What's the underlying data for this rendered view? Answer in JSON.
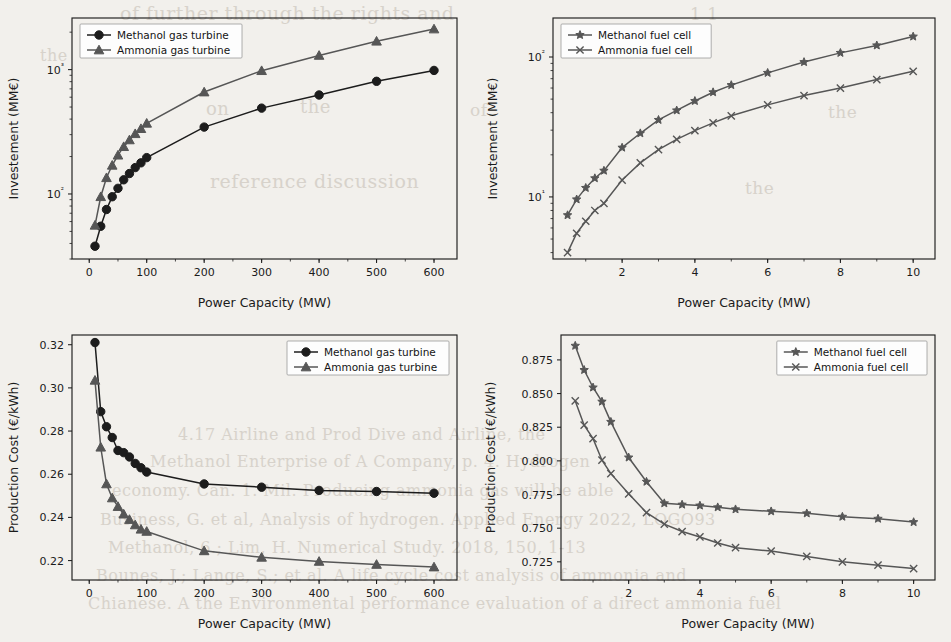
{
  "page": {
    "background_color": "#f2f0ec",
    "ghost_text_color": "#cfc9c0",
    "ghost_lines": [
      {
        "text": "of further through the rights and",
        "x": 120,
        "y": 2,
        "size": 19
      },
      {
        "text": "1 1",
        "x": 690,
        "y": 4,
        "size": 17
      },
      {
        "text": "the",
        "x": 40,
        "y": 46,
        "size": 16
      },
      {
        "text": "on",
        "x": 206,
        "y": 98,
        "size": 18
      },
      {
        "text": "the",
        "x": 300,
        "y": 96,
        "size": 18
      },
      {
        "text": "of",
        "x": 470,
        "y": 100,
        "size": 17
      },
      {
        "text": "the",
        "x": 828,
        "y": 102,
        "size": 17
      },
      {
        "text": "reference  discussion",
        "x": 210,
        "y": 170,
        "size": 19
      },
      {
        "text": "the",
        "x": 745,
        "y": 178,
        "size": 17
      },
      {
        "text": "4.17  Airline and Prod Dive and Airline, the",
        "x": 178,
        "y": 425,
        "size": 16
      },
      {
        "text": "Methanol Enterprise of A Company, p. 4. Hydrogen",
        "x": 150,
        "y": 452,
        "size": 16
      },
      {
        "text": "economy. Can. 1. Mil. Producing ammonia gas will be able",
        "x": 112,
        "y": 481,
        "size": 16
      },
      {
        "text": "Business, G. et al, Analysis of hydrogen. Applied Energy 2022, LOGO93",
        "x": 100,
        "y": 510,
        "size": 16
      },
      {
        "text": "Methanol, 6.; Lim, H. Numerical Study. 2018, 150, 1-13",
        "x": 108,
        "y": 538,
        "size": 16
      },
      {
        "text": "Bounes, J.; Lange, S.; et al. A life cycle cost analysis of ammonia and",
        "x": 96,
        "y": 566,
        "size": 16
      },
      {
        "text": "Chianese. A the Environmental performance evaluation of a direct ammonia fuel",
        "x": 88,
        "y": 594,
        "size": 16
      }
    ]
  },
  "figure": {
    "panels": [
      "investment-gas-turbine",
      "investment-fuel-cell",
      "production-cost-gas-turbine",
      "production-cost-fuel-cell"
    ]
  },
  "chart_data": [
    {
      "id": "investment-gas-turbine",
      "type": "line",
      "title": "",
      "xlabel": "Power Capacity (MW)",
      "ylabel": "Investement (MM€)",
      "yscale": "log",
      "xlim": [
        -30,
        640
      ],
      "ylim": [
        30,
        2600
      ],
      "xticks": [
        0,
        100,
        200,
        300,
        400,
        500,
        600
      ],
      "xticklabels": [
        "0",
        "100",
        "200",
        "300",
        "400",
        "500",
        "600"
      ],
      "yticks": [
        100,
        1000
      ],
      "yticklabels": [
        "10²",
        "10³"
      ],
      "grid": false,
      "legend_position": "upper left",
      "series": [
        {
          "name": "Methanol gas turbine",
          "color": "#1c1c1c",
          "marker": "circle",
          "x": [
            10,
            20,
            30,
            40,
            50,
            60,
            70,
            80,
            90,
            100,
            200,
            300,
            400,
            500,
            600
          ],
          "y": [
            38,
            55,
            75,
            95,
            111,
            130,
            146,
            163,
            178,
            196,
            345,
            490,
            625,
            805,
            985
          ]
        },
        {
          "name": "Ammonia gas turbine",
          "color": "#565656",
          "marker": "triangle",
          "x": [
            10,
            20,
            30,
            40,
            50,
            60,
            70,
            80,
            90,
            100,
            200,
            300,
            400,
            500,
            600
          ],
          "y": [
            56,
            95,
            135,
            170,
            205,
            240,
            272,
            305,
            335,
            370,
            660,
            980,
            1300,
            1690,
            2120
          ]
        }
      ]
    },
    {
      "id": "investment-fuel-cell",
      "type": "line",
      "title": "",
      "xlabel": "Power Capacity (MW)",
      "ylabel": "Investement (MM€)",
      "yscale": "log",
      "xlim": [
        0.1,
        10.6
      ],
      "ylim": [
        3.6,
        190
      ],
      "xticks": [
        2,
        4,
        6,
        8,
        10
      ],
      "xticklabels": [
        "2",
        "4",
        "6",
        "8",
        "10"
      ],
      "yticks": [
        10,
        100
      ],
      "yticklabels": [
        "10¹",
        "10²"
      ],
      "grid": false,
      "legend_position": "upper left",
      "series": [
        {
          "name": "Methanol fuel cell",
          "color": "#3a3a3a",
          "marker": "star",
          "x": [
            0.5,
            0.75,
            1.0,
            1.25,
            1.5,
            2.0,
            2.5,
            3.0,
            3.5,
            4.0,
            4.5,
            5.0,
            6.0,
            7.0,
            8.0,
            9.0,
            10.0
          ],
          "y": [
            7.4,
            9.6,
            11.6,
            13.6,
            15.4,
            22.5,
            28.5,
            35.5,
            41.5,
            48.5,
            56,
            63,
            77,
            92,
            107,
            121,
            140
          ]
        },
        {
          "name": "Ammonia fuel cell",
          "color": "#3a3a3a",
          "marker": "x",
          "x": [
            0.5,
            0.75,
            1.0,
            1.25,
            1.5,
            2.0,
            2.5,
            3.0,
            3.5,
            4.0,
            4.5,
            5.0,
            6.0,
            7.0,
            8.0,
            9.0,
            10.0
          ],
          "y": [
            4.0,
            5.5,
            6.7,
            8.0,
            9.0,
            13.2,
            17.5,
            21.8,
            25.8,
            29.8,
            33.8,
            38.0,
            45.5,
            53,
            60,
            69,
            79
          ]
        }
      ]
    },
    {
      "id": "production-cost-gas-turbine",
      "type": "line",
      "title": "",
      "xlabel": "Power Capacity (MW)",
      "ylabel": "Production Cost (€/kWh)",
      "yscale": "linear",
      "xlim": [
        -30,
        640
      ],
      "ylim": [
        0.211,
        0.3245
      ],
      "xticks": [
        0,
        100,
        200,
        300,
        400,
        500,
        600
      ],
      "xticklabels": [
        "0",
        "100",
        "200",
        "300",
        "400",
        "500",
        "600"
      ],
      "yticks": [
        0.22,
        0.24,
        0.26,
        0.28,
        0.3,
        0.32
      ],
      "yticklabels": [
        "0.22",
        "0.24",
        "0.26",
        "0.28",
        "0.30",
        "0.32"
      ],
      "grid": false,
      "legend_position": "upper right",
      "series": [
        {
          "name": "Methanol gas turbine",
          "color": "#1c1c1c",
          "marker": "circle",
          "x": [
            10,
            20,
            30,
            40,
            50,
            60,
            70,
            80,
            90,
            100,
            200,
            300,
            400,
            500,
            600
          ],
          "y": [
            0.321,
            0.289,
            0.282,
            0.277,
            0.271,
            0.27,
            0.268,
            0.265,
            0.263,
            0.261,
            0.2555,
            0.254,
            0.2525,
            0.252,
            0.2512
          ]
        },
        {
          "name": "Ammonia gas turbine",
          "color": "#565656",
          "marker": "triangle",
          "x": [
            10,
            20,
            30,
            40,
            50,
            60,
            70,
            80,
            90,
            100,
            200,
            300,
            400,
            500,
            600
          ],
          "y": [
            0.3035,
            0.2725,
            0.2555,
            0.249,
            0.245,
            0.2415,
            0.239,
            0.2365,
            0.2345,
            0.2335,
            0.2245,
            0.2215,
            0.2196,
            0.2182,
            0.217
          ]
        }
      ]
    },
    {
      "id": "production-cost-fuel-cell",
      "type": "line",
      "title": "",
      "xlabel": "Power Capacity (MW)",
      "ylabel": "Production Cost (€/kWh)",
      "yscale": "linear",
      "xlim": [
        0.1,
        10.6
      ],
      "ylim": [
        0.7115,
        0.8935
      ],
      "xticks": [
        2,
        4,
        6,
        8,
        10
      ],
      "xticklabels": [
        "2",
        "4",
        "6",
        "8",
        "10"
      ],
      "yticks": [
        0.725,
        0.75,
        0.775,
        0.8,
        0.825,
        0.85,
        0.875
      ],
      "yticklabels": [
        "0.725",
        "0.750",
        "0.775",
        "0.800",
        "0.825",
        "0.850",
        "0.875"
      ],
      "grid": false,
      "legend_position": "upper right",
      "series": [
        {
          "name": "Methanol fuel cell",
          "color": "#3a3a3a",
          "marker": "star",
          "x": [
            0.5,
            0.75,
            1.0,
            1.25,
            1.5,
            2.0,
            2.5,
            3.0,
            3.5,
            4.0,
            4.5,
            5.0,
            6.0,
            7.0,
            8.0,
            9.0,
            10.0
          ],
          "y": [
            0.8855,
            0.8675,
            0.8545,
            0.844,
            0.829,
            0.8025,
            0.7845,
            0.7685,
            0.7675,
            0.7668,
            0.7655,
            0.764,
            0.7625,
            0.761,
            0.7585,
            0.757,
            0.7545
          ]
        },
        {
          "name": "Ammonia fuel cell",
          "color": "#3a3a3a",
          "marker": "x",
          "x": [
            0.5,
            0.75,
            1.0,
            1.25,
            1.5,
            2.0,
            2.5,
            3.0,
            3.5,
            4.0,
            4.5,
            5.0,
            6.0,
            7.0,
            8.0,
            9.0,
            10.0
          ],
          "y": [
            0.8445,
            0.8265,
            0.8165,
            0.8005,
            0.7905,
            0.7755,
            0.7615,
            0.753,
            0.7475,
            0.7435,
            0.739,
            0.7355,
            0.733,
            0.729,
            0.725,
            0.7225,
            0.72
          ]
        }
      ]
    }
  ]
}
